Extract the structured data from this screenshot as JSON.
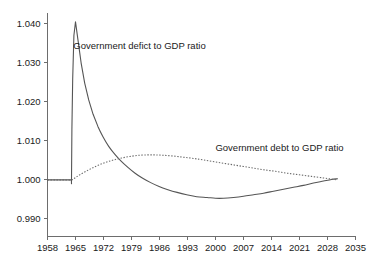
{
  "chart_data": {
    "type": "line",
    "title": "",
    "xlabel": "",
    "ylabel": "",
    "grid": false,
    "legend_position": "inline-annotations",
    "xlim": [
      1958,
      2035
    ],
    "ylim": [
      0.9855,
      1.0425
    ],
    "x_ticks": [
      "1958",
      "1965",
      "1972",
      "1979",
      "1986",
      "1993",
      "2000",
      "2007",
      "2014",
      "2021",
      "2028",
      "2035"
    ],
    "y_ticks": [
      "0.990",
      "1.000",
      "1.010",
      "1.020",
      "1.030",
      "1.040"
    ],
    "annotations": [
      {
        "text": "Government defict to GDP ratio",
        "x": 1981,
        "y": 1.0335
      },
      {
        "text": "Government debt to GDP ratio",
        "x": 2016,
        "y": 1.0073
      }
    ],
    "series": [
      {
        "name": "Government defict to GDP ratio",
        "style": "solid",
        "color": "#555555",
        "points": [
          [
            1958.0,
            1.0
          ],
          [
            1960.0,
            1.0
          ],
          [
            1962.0,
            1.0
          ],
          [
            1963.8,
            1.0
          ],
          [
            1964.0,
            1.0
          ],
          [
            1964.1,
            1.013
          ],
          [
            1964.3,
            1.026
          ],
          [
            1964.6,
            1.037
          ],
          [
            1965.0,
            1.0405
          ],
          [
            1965.6,
            1.036
          ],
          [
            1966.4,
            1.03
          ],
          [
            1967.3,
            1.0248
          ],
          [
            1968.3,
            1.0205
          ],
          [
            1969.4,
            1.0168
          ],
          [
            1970.6,
            1.0137
          ],
          [
            1971.9,
            1.011
          ],
          [
            1973.3,
            1.0086
          ],
          [
            1974.8,
            1.0066
          ],
          [
            1976.4,
            1.0048
          ],
          [
            1978.1,
            1.0032
          ],
          [
            1979.9,
            1.0017
          ],
          [
            1981.8,
            1.0004
          ],
          [
            1983.8,
            0.9993
          ],
          [
            1985.9,
            0.9983
          ],
          [
            1988.1,
            0.9975
          ],
          [
            1990.4,
            0.9968
          ],
          [
            1992.8,
            0.9962
          ],
          [
            1995.3,
            0.9957
          ],
          [
            1997.9,
            0.9955
          ],
          [
            2000.0,
            0.9953
          ],
          [
            2002.0,
            0.9953
          ],
          [
            2004.5,
            0.9955
          ],
          [
            2007.0,
            0.9958
          ],
          [
            2009.5,
            0.9962
          ],
          [
            2012.0,
            0.9966
          ],
          [
            2014.5,
            0.9971
          ],
          [
            2017.0,
            0.9976
          ],
          [
            2019.5,
            0.9981
          ],
          [
            2022.0,
            0.9986
          ],
          [
            2024.5,
            0.9992
          ],
          [
            2027.0,
            0.9997
          ],
          [
            2029.0,
            1.0001
          ],
          [
            2030.5,
            1.0003
          ]
        ]
      },
      {
        "name": "Government debt to GDP ratio",
        "style": "dotted",
        "color": "#6a6a6a",
        "points": [
          [
            1958.0,
            1.0
          ],
          [
            1960.0,
            1.0
          ],
          [
            1962.0,
            1.0
          ],
          [
            1964.0,
            1.0
          ],
          [
            1965.0,
            1.0006
          ],
          [
            1966.2,
            1.0014
          ],
          [
            1967.6,
            1.0022
          ],
          [
            1969.1,
            1.003
          ],
          [
            1970.8,
            1.0038
          ],
          [
            1972.6,
            1.0045
          ],
          [
            1974.5,
            1.0051
          ],
          [
            1976.5,
            1.0056
          ],
          [
            1978.6,
            1.006
          ],
          [
            1980.8,
            1.0063
          ],
          [
            1983.0,
            1.0064
          ],
          [
            1985.0,
            1.0064
          ],
          [
            1987.0,
            1.0063
          ],
          [
            1989.5,
            1.0061
          ],
          [
            1992.0,
            1.0058
          ],
          [
            1994.5,
            1.0055
          ],
          [
            1997.0,
            1.0051
          ],
          [
            2000.0,
            1.0046
          ],
          [
            2003.0,
            1.0041
          ],
          [
            2006.0,
            1.0036
          ],
          [
            2009.0,
            1.0031
          ],
          [
            2012.0,
            1.0026
          ],
          [
            2015.0,
            1.0022
          ],
          [
            2018.0,
            1.0017
          ],
          [
            2021.0,
            1.0013
          ],
          [
            2024.0,
            1.0009
          ],
          [
            2027.0,
            1.0005
          ],
          [
            2029.0,
            1.0002
          ],
          [
            2030.5,
            1.0
          ]
        ]
      }
    ]
  }
}
